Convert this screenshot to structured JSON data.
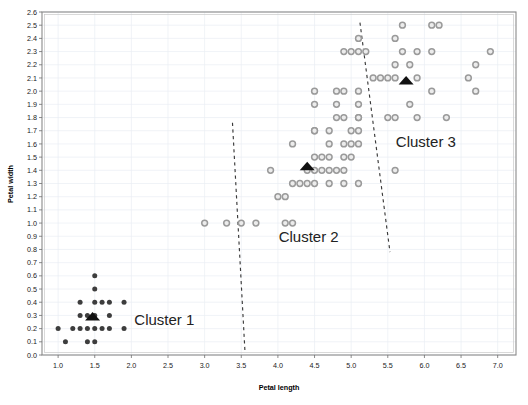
{
  "chart_data": {
    "type": "scatter",
    "title": "",
    "xlabel": "Petal length",
    "ylabel": "Petal width",
    "xlim": [
      0.78,
      7.25
    ],
    "ylim": [
      0.0,
      2.6
    ],
    "grid": true,
    "legend_position": "in-plot-annotations",
    "xticks": [
      "1.0",
      "1.5",
      "2.0",
      "2.5",
      "3.0",
      "3.5",
      "4.0",
      "4.5",
      "5.0",
      "5.5",
      "6.0",
      "6.5",
      "7.0"
    ],
    "xtick_values": [
      1.0,
      1.5,
      2.0,
      2.5,
      3.0,
      3.5,
      4.0,
      4.5,
      5.0,
      5.5,
      6.0,
      6.5,
      7.0
    ],
    "yticks": [
      "0.0",
      "0.1",
      "0.2",
      "0.3",
      "0.4",
      "0.5",
      "0.6",
      "0.7",
      "0.8",
      "0.9",
      "1.0",
      "1.1",
      "1.2",
      "1.3",
      "1.4",
      "1.5",
      "1.6",
      "1.7",
      "1.8",
      "1.9",
      "2.0",
      "2.1",
      "2.2",
      "2.3",
      "2.4",
      "2.5",
      "2.6"
    ],
    "ytick_values": [
      0.0,
      0.1,
      0.2,
      0.3,
      0.4,
      0.5,
      0.6,
      0.7,
      0.8,
      0.9,
      1.0,
      1.1,
      1.2,
      1.3,
      1.4,
      1.5,
      1.6,
      1.7,
      1.8,
      1.9,
      2.0,
      2.1,
      2.2,
      2.3,
      2.4,
      2.5,
      2.6
    ],
    "annotations": [
      {
        "text": "Cluster 1",
        "x": 2.45,
        "y": 0.23
      },
      {
        "text": "Cluster 2",
        "x": 4.42,
        "y": 0.86
      },
      {
        "text": "Cluster 3",
        "x": 6.02,
        "y": 1.58
      }
    ],
    "separators": [
      {
        "name": "cluster1-cluster2-boundary",
        "x1": 3.38,
        "y1": 1.76,
        "x2": 3.55,
        "y2": 0.03
      },
      {
        "name": "cluster2-cluster3-boundary",
        "x1": 5.12,
        "y1": 2.52,
        "x2": 5.53,
        "y2": 0.78
      }
    ],
    "series": [
      {
        "name": "Cluster 1",
        "marker": "filled-circle",
        "color": "#3d3d3d",
        "centroid": {
          "x": 1.47,
          "y": 0.29
        },
        "points": [
          [
            1.5,
            0.6
          ],
          [
            1.5,
            0.5
          ],
          [
            1.3,
            0.4
          ],
          [
            1.5,
            0.4
          ],
          [
            1.6,
            0.4
          ],
          [
            1.7,
            0.4
          ],
          [
            1.9,
            0.4
          ],
          [
            1.3,
            0.3
          ],
          [
            1.4,
            0.3
          ],
          [
            1.5,
            0.3
          ],
          [
            1.7,
            0.3
          ],
          [
            1.0,
            0.2
          ],
          [
            1.2,
            0.2
          ],
          [
            1.3,
            0.2
          ],
          [
            1.4,
            0.2
          ],
          [
            1.5,
            0.2
          ],
          [
            1.6,
            0.2
          ],
          [
            1.7,
            0.2
          ],
          [
            1.9,
            0.2
          ],
          [
            1.1,
            0.1
          ],
          [
            1.4,
            0.1
          ],
          [
            1.5,
            0.1
          ]
        ]
      },
      {
        "name": "Cluster 2",
        "marker": "open-circle",
        "color": "#9a9a9a",
        "centroid": {
          "x": 4.4,
          "y": 1.43
        },
        "points": [
          [
            4.8,
            1.8
          ],
          [
            5.1,
            1.8
          ],
          [
            4.5,
            1.7
          ],
          [
            5.0,
            1.7
          ],
          [
            5.1,
            1.7
          ],
          [
            4.2,
            1.6
          ],
          [
            4.7,
            1.6
          ],
          [
            4.9,
            1.6
          ],
          [
            5.0,
            1.6
          ],
          [
            5.1,
            1.6
          ],
          [
            4.5,
            1.5
          ],
          [
            4.6,
            1.5
          ],
          [
            4.7,
            1.5
          ],
          [
            4.9,
            1.5
          ],
          [
            5.0,
            1.5
          ],
          [
            3.9,
            1.4
          ],
          [
            4.4,
            1.4
          ],
          [
            4.5,
            1.4
          ],
          [
            4.6,
            1.4
          ],
          [
            4.7,
            1.4
          ],
          [
            4.8,
            1.4
          ],
          [
            4.9,
            1.4
          ],
          [
            4.2,
            1.3
          ],
          [
            4.3,
            1.3
          ],
          [
            4.4,
            1.3
          ],
          [
            4.5,
            1.3
          ],
          [
            4.7,
            1.3
          ],
          [
            4.9,
            1.3
          ],
          [
            5.1,
            1.3
          ],
          [
            4.0,
            1.2
          ],
          [
            4.1,
            1.2
          ],
          [
            3.0,
            1.0
          ],
          [
            3.3,
            1.0
          ],
          [
            3.5,
            1.0
          ],
          [
            3.7,
            1.0
          ],
          [
            4.1,
            1.0
          ],
          [
            4.2,
            1.0
          ]
        ]
      },
      {
        "name": "Cluster 3",
        "marker": "open-circle",
        "color": "#9a9a9a",
        "centroid": {
          "x": 5.75,
          "y": 2.08
        },
        "points": [
          [
            5.7,
            2.5
          ],
          [
            6.1,
            2.5
          ],
          [
            6.2,
            2.5
          ],
          [
            5.1,
            2.4
          ],
          [
            5.6,
            2.4
          ],
          [
            4.9,
            2.3
          ],
          [
            5.0,
            2.3
          ],
          [
            5.1,
            2.3
          ],
          [
            5.2,
            2.3
          ],
          [
            5.7,
            2.3
          ],
          [
            5.9,
            2.3
          ],
          [
            6.1,
            2.3
          ],
          [
            6.9,
            2.3
          ],
          [
            5.6,
            2.2
          ],
          [
            5.8,
            2.2
          ],
          [
            6.7,
            2.2
          ],
          [
            5.3,
            2.1
          ],
          [
            5.4,
            2.1
          ],
          [
            5.5,
            2.1
          ],
          [
            5.6,
            2.1
          ],
          [
            5.9,
            2.1
          ],
          [
            6.6,
            2.1
          ],
          [
            4.5,
            2.0
          ],
          [
            4.8,
            2.0
          ],
          [
            4.9,
            2.0
          ],
          [
            5.1,
            2.0
          ],
          [
            6.1,
            2.0
          ],
          [
            6.7,
            2.0
          ],
          [
            4.5,
            1.9
          ],
          [
            4.8,
            1.9
          ],
          [
            5.1,
            1.9
          ],
          [
            5.8,
            1.9
          ],
          [
            4.9,
            1.8
          ],
          [
            5.1,
            1.8
          ],
          [
            5.5,
            1.8
          ],
          [
            5.6,
            1.8
          ],
          [
            5.9,
            1.8
          ],
          [
            6.3,
            1.8
          ],
          [
            4.5,
            1.7
          ],
          [
            4.7,
            1.7
          ],
          [
            5.6,
            1.4
          ]
        ]
      }
    ]
  }
}
